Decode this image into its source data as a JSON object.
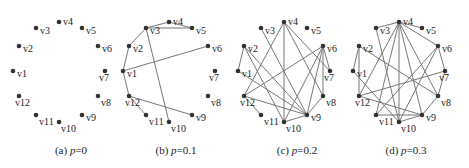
{
  "figure": {
    "node_color": "#333333",
    "edge_color": "#777777",
    "label_color": "#222222",
    "node_labels": [
      "v1",
      "v2",
      "v3",
      "v4",
      "v5",
      "v6",
      "v7",
      "v8",
      "v9",
      "v10",
      "v11",
      "v12"
    ],
    "node_positions": {
      "v1": [
        13,
        71
      ],
      "v2": [
        19,
        46
      ],
      "v3": [
        36,
        28
      ],
      "v4": [
        59,
        22
      ],
      "v5": [
        82,
        28
      ],
      "v6": [
        98,
        46
      ],
      "v7": [
        105,
        71
      ],
      "v8": [
        98,
        96
      ],
      "v9": [
        82,
        115
      ],
      "v10": [
        59,
        122
      ],
      "v11": [
        36,
        115
      ],
      "v12": [
        19,
        96
      ]
    }
  },
  "panels": [
    {
      "id": "a",
      "offset_x": 0,
      "caption_prefix": "(a) ",
      "caption_var": "p",
      "caption_value": "=0",
      "p": 0,
      "edges": []
    },
    {
      "id": "b",
      "offset_x": 110,
      "caption_prefix": "(b) ",
      "caption_var": "p",
      "caption_value": "=0.1",
      "p": 0.1,
      "edges": [
        [
          "v3",
          "v4"
        ],
        [
          "v4",
          "v5"
        ],
        [
          "v3",
          "v5"
        ],
        [
          "v2",
          "v3"
        ],
        [
          "v1",
          "v2"
        ],
        [
          "v1",
          "v6"
        ],
        [
          "v3",
          "v10"
        ],
        [
          "v1",
          "v12"
        ],
        [
          "v12",
          "v11"
        ],
        [
          "v12",
          "v9"
        ]
      ]
    },
    {
      "id": "c",
      "offset_x": 225,
      "caption_prefix": "(c) ",
      "caption_var": "p",
      "caption_value": "=0.2",
      "p": 0.2,
      "edges": [
        [
          "v1",
          "v2"
        ],
        [
          "v2",
          "v9"
        ],
        [
          "v2",
          "v10"
        ],
        [
          "v1",
          "v9"
        ],
        [
          "v3",
          "v9"
        ],
        [
          "v4",
          "v12"
        ],
        [
          "v4",
          "v8"
        ],
        [
          "v4",
          "v7"
        ],
        [
          "v6",
          "v7"
        ],
        [
          "v6",
          "v8"
        ],
        [
          "v6",
          "v12"
        ],
        [
          "v6",
          "v10"
        ],
        [
          "v6",
          "v9"
        ],
        [
          "v12",
          "v9"
        ],
        [
          "v12",
          "v11"
        ],
        [
          "v10",
          "v9"
        ],
        [
          "v8",
          "v9"
        ],
        [
          "v4",
          "v10"
        ]
      ]
    },
    {
      "id": "d",
      "offset_x": 340,
      "caption_prefix": "(d) ",
      "caption_var": "p",
      "caption_value": "=0.3",
      "p": 0.3,
      "edges": [
        [
          "v1",
          "v2"
        ],
        [
          "v2",
          "v12"
        ],
        [
          "v2",
          "v8"
        ],
        [
          "v3",
          "v4"
        ],
        [
          "v3",
          "v10"
        ],
        [
          "v4",
          "v5"
        ],
        [
          "v4",
          "v6"
        ],
        [
          "v4",
          "v10"
        ],
        [
          "v4",
          "v9"
        ],
        [
          "v4",
          "v8"
        ],
        [
          "v4",
          "v12"
        ],
        [
          "v4",
          "v11"
        ],
        [
          "v6",
          "v7"
        ],
        [
          "v6",
          "v11"
        ],
        [
          "v6",
          "v10"
        ],
        [
          "v7",
          "v8"
        ],
        [
          "v7",
          "v12"
        ],
        [
          "v8",
          "v9"
        ],
        [
          "v9",
          "v10"
        ],
        [
          "v9",
          "v11"
        ],
        [
          "v12",
          "v9"
        ],
        [
          "v1",
          "v10"
        ]
      ]
    }
  ]
}
